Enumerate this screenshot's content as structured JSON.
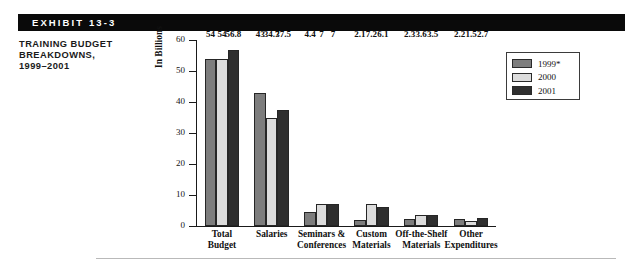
{
  "exhibit": {
    "tag_label": "EXHIBIT 13-3",
    "title_lines": [
      "TRAINING BUDGET",
      "BREAKDOWNS,",
      "1999–2001"
    ]
  },
  "legend": {
    "position": "top-right",
    "entries": [
      {
        "label": "1999*",
        "color": "#7d7d7d"
      },
      {
        "label": "2000",
        "color": "#dcdcdc"
      },
      {
        "label": "2001",
        "color": "#2f2f2f"
      }
    ]
  },
  "chart_data": {
    "type": "bar",
    "title": "TRAINING BUDGET BREAKDOWNS, 1999–2001",
    "xlabel": "",
    "ylabel": "In Billions",
    "ylim": [
      0,
      60
    ],
    "yticks": [
      0,
      10,
      20,
      30,
      40,
      50,
      60
    ],
    "ytick_labels": [
      "0",
      "10",
      "20",
      "30",
      "40",
      "50",
      "60"
    ],
    "grid": false,
    "legend_position": "top-right",
    "categories": [
      "Total Budget",
      "Salaries",
      "Seminars & Conferences",
      "Custom Materials",
      "Off-the-Shelf Materials",
      "Other Expenditures"
    ],
    "category_label_lines": [
      [
        "Total",
        "Budget"
      ],
      [
        "Salaries"
      ],
      [
        "Seminars &",
        "Conferences"
      ],
      [
        "Custom",
        "Materials"
      ],
      [
        "Off-the-Shelf",
        "Materials"
      ],
      [
        "Other",
        "Expenditures"
      ]
    ],
    "series": [
      {
        "name": "1999*",
        "color": "#7d7d7d",
        "values": [
          54,
          43,
          4.4,
          2.1,
          2.3,
          2.2
        ],
        "labels": [
          "54",
          "43",
          "4.4",
          "2.1",
          "2.3",
          "2.2"
        ]
      },
      {
        "name": "2000",
        "color": "#dcdcdc",
        "values": [
          54,
          34.7,
          7,
          7.2,
          3.6,
          1.5
        ],
        "labels": [
          "54",
          "34.7",
          "7",
          "7.2",
          "3.6",
          "1.5"
        ]
      },
      {
        "name": "2001",
        "color": "#2f2f2f",
        "values": [
          56.8,
          37.5,
          7,
          6.1,
          3.5,
          2.7
        ],
        "labels": [
          "56.8",
          "37.5",
          "7",
          "6.1",
          "3.5",
          "2.7"
        ]
      }
    ]
  }
}
